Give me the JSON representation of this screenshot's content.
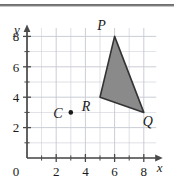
{
  "figure": {
    "title": "",
    "top_rule": true,
    "background": "#ffffff",
    "grid_color": "#c9ccd4",
    "axis_color": "#4a4a4a",
    "text_color": "#1a1a1a",
    "shape_fill": "#8a8a8a",
    "shape_stroke": "#333333"
  },
  "axes": {
    "x_label": "x",
    "y_label": "y",
    "origin_label": "0",
    "x_ticks": [
      "2",
      "4",
      "6",
      "8"
    ],
    "x_tick_values": [
      2,
      4,
      6,
      8
    ],
    "y_ticks": [
      "2",
      "4",
      "6",
      "8"
    ],
    "y_tick_values": [
      2,
      4,
      6,
      8
    ],
    "x_range": [
      0,
      9
    ],
    "y_range": [
      0,
      8.7
    ],
    "grid_step": 1
  },
  "chart_data": {
    "type": "scatter",
    "title": "",
    "xlabel": "x",
    "ylabel": "y",
    "xlim": [
      0,
      9
    ],
    "ylim": [
      0,
      8.7
    ],
    "grid": true,
    "legend": false,
    "shapes": [
      {
        "name": "triangle-PQR",
        "kind": "polygon",
        "fill": "#8a8a8a",
        "stroke": "#333333",
        "vertices": [
          {
            "label": "P",
            "x": 6,
            "y": 8
          },
          {
            "label": "Q",
            "x": 8,
            "y": 3
          },
          {
            "label": "R",
            "x": 5,
            "y": 4
          }
        ]
      }
    ],
    "points": [
      {
        "label": "C",
        "x": 3,
        "y": 3,
        "marker": "dot",
        "color": "#1a1a1a"
      }
    ],
    "labels": [
      {
        "text": "P",
        "x": 6,
        "y": 8,
        "dx": -13,
        "dy": -6
      },
      {
        "text": "Q",
        "x": 8,
        "y": 3,
        "dx": 4,
        "dy": 14
      },
      {
        "text": "R",
        "x": 5,
        "y": 4,
        "dx": -14,
        "dy": 14
      },
      {
        "text": "C",
        "x": 3,
        "y": 3,
        "dx": -13,
        "dy": 6
      }
    ]
  }
}
